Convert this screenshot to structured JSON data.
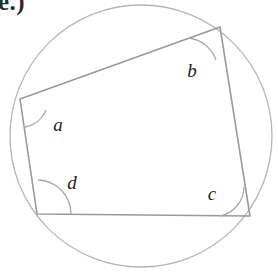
{
  "figure": {
    "kind": "cyclic-quadrilateral-inscribed-in-circle",
    "problem_label": "e.)",
    "stroke_color": "#9a9a9a",
    "circle_stroke_color": "#b6b6b6",
    "arc_stroke_color": "#a8a8a8",
    "label_color": "#1d1d1d",
    "background_color": "#ffffff",
    "circle": {
      "cx": 141,
      "cy": 136,
      "r": 131
    },
    "vertices": [
      {
        "id": "A",
        "x": 20,
        "y": 99,
        "angle_label": "a"
      },
      {
        "id": "B",
        "x": 220,
        "y": 27,
        "angle_label": "b"
      },
      {
        "id": "C",
        "x": 250,
        "y": 216,
        "angle_label": "c"
      },
      {
        "id": "D",
        "x": 37,
        "y": 214,
        "angle_label": "d"
      }
    ],
    "sides": [
      {
        "from": "A",
        "to": "B"
      },
      {
        "from": "B",
        "to": "C"
      },
      {
        "from": "C",
        "to": "D"
      },
      {
        "from": "D",
        "to": "A"
      }
    ],
    "angle_labels": [
      {
        "text": "a",
        "x": 58,
        "y": 124
      },
      {
        "text": "b",
        "x": 192,
        "y": 70
      },
      {
        "text": "c",
        "x": 212,
        "y": 193
      },
      {
        "text": "d",
        "x": 72,
        "y": 182
      }
    ],
    "angle_arcs": [
      {
        "vertex": "A",
        "d": "M 46 110 A 28 28 0 0 1 25 127"
      },
      {
        "vertex": "B",
        "d": "M 189 38 A 33 33 0 0 1 216 60"
      },
      {
        "vertex": "C",
        "d": "M 220 216 A 30 30 0 0 0 244 187"
      },
      {
        "vertex": "D",
        "d": "M 38 180 A 34 34 0 0 1 71 214"
      }
    ]
  }
}
